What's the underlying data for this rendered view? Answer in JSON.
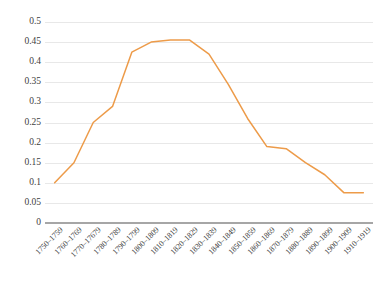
{
  "chart_data": {
    "type": "line",
    "title": "",
    "subtitle": "",
    "xlabel": "",
    "ylabel": "",
    "categories": [
      "1750–1759",
      "1760–1769",
      "1770–17679",
      "1780–1789",
      "1790–1799",
      "1800–1809",
      "1810–1819",
      "1820–1829",
      "1830–1839",
      "1840–1849",
      "1850–1859",
      "1860–1869",
      "1870–1879",
      "1880–1889",
      "1890–1899",
      "1900–1909",
      "1910–1919"
    ],
    "values": [
      0.1,
      0.15,
      0.25,
      0.29,
      0.425,
      0.45,
      0.455,
      0.455,
      0.42,
      0.345,
      0.26,
      0.19,
      0.185,
      0.15,
      0.12,
      0.075,
      0.075
    ],
    "series": [
      {
        "name": "series-1",
        "color": "#ED9B49",
        "values": [
          0.1,
          0.15,
          0.25,
          0.29,
          0.425,
          0.45,
          0.455,
          0.455,
          0.42,
          0.345,
          0.26,
          0.19,
          0.185,
          0.15,
          0.12,
          0.075,
          0.075
        ]
      }
    ],
    "ylim": [
      0,
      0.5
    ],
    "ytick_values": [
      0,
      0.05,
      0.1,
      0.15,
      0.2,
      0.25,
      0.3,
      0.35,
      0.4,
      0.45,
      0.5
    ],
    "ytick_labels": [
      "0",
      "0.05",
      "0.1",
      "0.15",
      "0.2",
      "0.25",
      "0.3",
      "0.35",
      "0.4",
      "0.45",
      "0.5"
    ],
    "grid": true,
    "grid_axis": "y",
    "legend": false,
    "legend_position": "none",
    "markers": false,
    "line_width": 1.5,
    "background_color": "#ffffff",
    "grid_color": "#e8e8e8",
    "axis_color": "#a6a6a6",
    "text_color": "#404040",
    "xtick_rotation": -45
  }
}
